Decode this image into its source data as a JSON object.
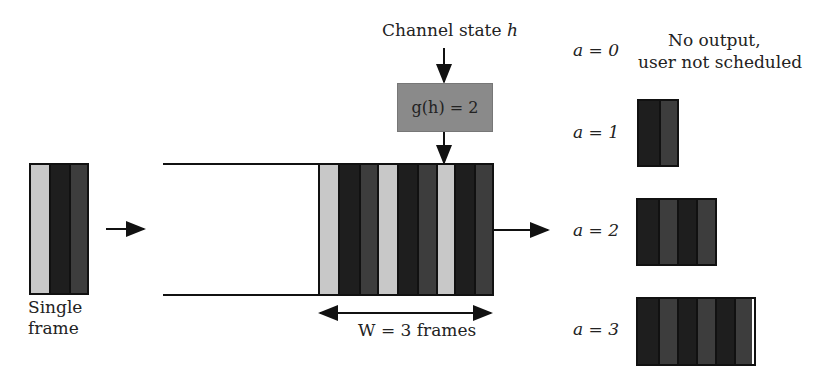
{
  "channel": {
    "label": "Channel state",
    "var": "h"
  },
  "function_box": {
    "text": "g(h) = 2",
    "color": "#8a8a8a"
  },
  "input": {
    "label_line1": "Single",
    "label_line2": "frame"
  },
  "buffer": {
    "width_label": "W = 3 frames"
  },
  "outputs": [
    {
      "a_label": "a = 0",
      "description_line1": "No output,",
      "description_line2": "user not scheduled"
    },
    {
      "a_label": "a = 1"
    },
    {
      "a_label": "a = 2"
    },
    {
      "a_label": "a = 3"
    }
  ],
  "colors": {
    "light_strip": "#c8c8c8",
    "black_strip": "#1e1e1e",
    "dark_grey_strip": "#3d3d3d"
  }
}
